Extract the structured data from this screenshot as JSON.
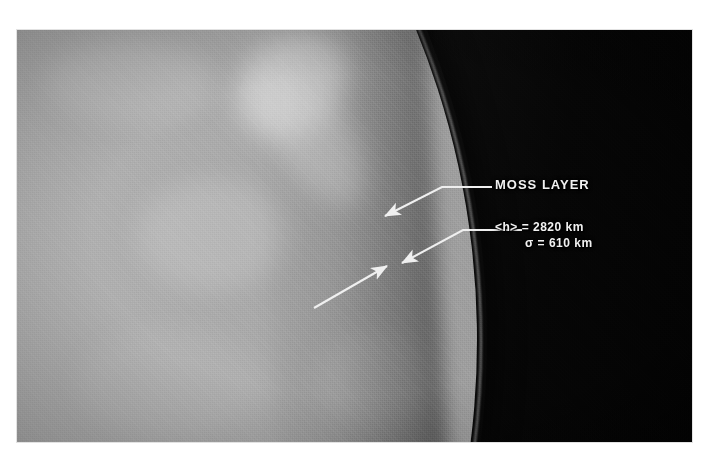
{
  "figure": {
    "kind": "solar-limb-image",
    "frame": {
      "background_color": "#ffffff",
      "disk_color": "#b6b6b6",
      "sky_color": "#060606",
      "annotation_color": "#f2f2f2"
    }
  },
  "annotations": {
    "moss_label": "MOSS LAYER",
    "height_label": "<h> = 2820 km",
    "height_symbol": "<h>",
    "height_equals": "=",
    "height_value": "2820",
    "height_unit": "km",
    "sigma_label": "σ = 610 km",
    "sigma_symbol": "σ",
    "sigma_equals": "=",
    "sigma_value": "610",
    "sigma_unit": "km",
    "arrows": [
      {
        "name": "moss-layer-arrow",
        "points_to": "bright moss layer on the limb",
        "direction": "down-left"
      },
      {
        "name": "height-arrow",
        "points_to": "upper boundary of the measured layer",
        "direction": "down-left"
      },
      {
        "name": "limb-arrow",
        "points_to": "limb edge from inside the disk",
        "direction": "up-right"
      }
    ]
  }
}
